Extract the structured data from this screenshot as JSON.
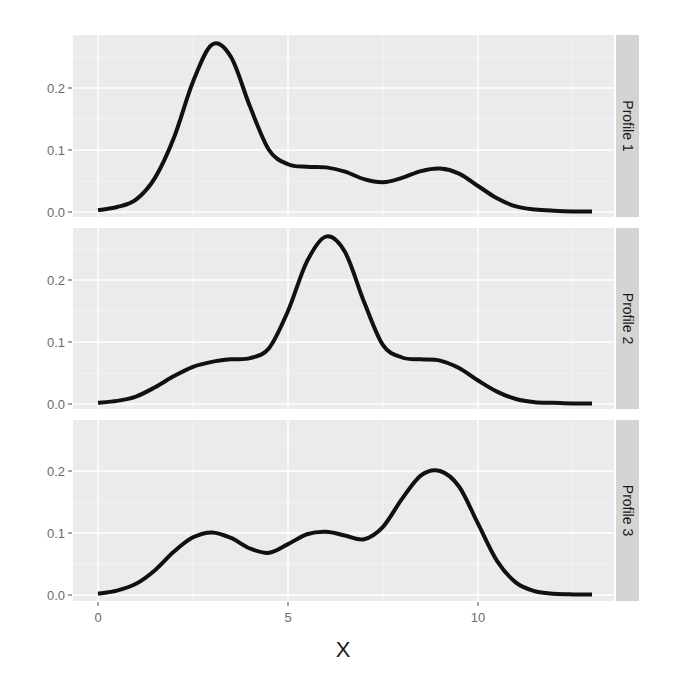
{
  "chart_data": {
    "type": "line",
    "title": "",
    "xlabel": "X",
    "ylabel": "",
    "layout": "facet_grid rows",
    "grid": true,
    "xlim": [
      -0.65,
      13.6
    ],
    "x_ticks": [
      0,
      5,
      10
    ],
    "x_tick_labels": [
      "0",
      "5",
      "10"
    ],
    "y_ticks": [
      0.0,
      0.1,
      0.2
    ],
    "y_tick_labels": [
      "0.0",
      "0.1",
      "0.2"
    ],
    "x": [
      0,
      0.5,
      1,
      1.5,
      2,
      2.5,
      3,
      3.5,
      4,
      4.5,
      5,
      5.5,
      6,
      6.5,
      7,
      7.5,
      8,
      8.5,
      9,
      9.5,
      10,
      10.5,
      11,
      11.5,
      12,
      12.5,
      13
    ],
    "series": [
      {
        "name": "Profile 1",
        "values": [
          0.003,
          0.008,
          0.02,
          0.055,
          0.12,
          0.21,
          0.27,
          0.25,
          0.17,
          0.1,
          0.077,
          0.073,
          0.072,
          0.065,
          0.053,
          0.048,
          0.055,
          0.066,
          0.07,
          0.062,
          0.042,
          0.022,
          0.009,
          0.004,
          0.002,
          0.001,
          0.001
        ]
      },
      {
        "name": "Profile 2",
        "values": [
          0.002,
          0.005,
          0.012,
          0.027,
          0.045,
          0.06,
          0.068,
          0.072,
          0.074,
          0.09,
          0.15,
          0.23,
          0.27,
          0.245,
          0.165,
          0.095,
          0.075,
          0.072,
          0.07,
          0.058,
          0.038,
          0.02,
          0.008,
          0.003,
          0.002,
          0.001,
          0.001
        ]
      },
      {
        "name": "Profile 3",
        "values": [
          0.002,
          0.007,
          0.018,
          0.04,
          0.07,
          0.093,
          0.101,
          0.092,
          0.075,
          0.068,
          0.082,
          0.098,
          0.102,
          0.096,
          0.09,
          0.11,
          0.155,
          0.193,
          0.2,
          0.175,
          0.115,
          0.055,
          0.02,
          0.006,
          0.002,
          0.001,
          0.001
        ]
      }
    ],
    "panel_background": "#ebebeb",
    "strip_background": "#d4d4d4",
    "line_color": "#111111"
  },
  "panels": [
    {
      "strip": "Profile 1"
    },
    {
      "strip": "Profile 2"
    },
    {
      "strip": "Profile 3"
    }
  ]
}
